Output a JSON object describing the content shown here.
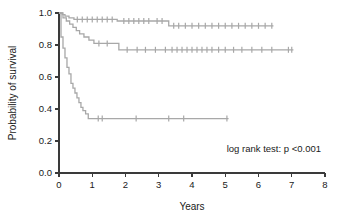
{
  "figure": {
    "width": 337,
    "height": 216,
    "background": "#ffffff"
  },
  "annotations": {
    "log_rank": "log rank test: p <0.001"
  },
  "chart_data": {
    "type": "line",
    "chart_kind": "kaplan-meier-survival",
    "title": "",
    "xlabel": "Years",
    "ylabel": "Probability of survival",
    "xlim": [
      0,
      8
    ],
    "ylim": [
      0.0,
      1.0
    ],
    "xticks": [
      0,
      1,
      2,
      3,
      4,
      5,
      6,
      7,
      8
    ],
    "xtick_labels": [
      "0",
      "1",
      "2",
      "3",
      "4",
      "5",
      "6",
      "7",
      "8"
    ],
    "yticks": [
      0.0,
      0.2,
      0.4,
      0.6,
      0.8,
      1.0
    ],
    "ytick_labels": [
      "0.0",
      "0.2",
      "0.4",
      "0.6",
      "0.8",
      "1.0"
    ],
    "grid": false,
    "legend": false,
    "legend_position": "none",
    "line_color": "#a8a8a8",
    "annotation_text": "log rank test: p <0.001",
    "series": [
      {
        "name": "curve-1-high-survival",
        "color": "#a8a8a8",
        "step": "post",
        "final_survival": 0.92,
        "x": [
          0.0,
          0.1,
          0.18,
          0.3,
          0.45,
          1.75,
          3.3,
          6.45
        ],
        "y": [
          1.0,
          0.99,
          0.98,
          0.97,
          0.96,
          0.95,
          0.92,
          0.92
        ],
        "censor_x": [
          0.55,
          0.7,
          0.85,
          1.0,
          1.15,
          1.3,
          1.45,
          1.6,
          1.95,
          2.1,
          2.25,
          2.4,
          2.55,
          2.7,
          2.95,
          3.1,
          3.45,
          3.6,
          3.8,
          4.0,
          4.2,
          4.4,
          4.6,
          4.8,
          5.0,
          5.2,
          5.4,
          5.6,
          5.8,
          6.0,
          6.2,
          6.4
        ],
        "censor_y": [
          0.96,
          0.96,
          0.96,
          0.96,
          0.96,
          0.96,
          0.96,
          0.96,
          0.95,
          0.95,
          0.95,
          0.95,
          0.95,
          0.95,
          0.95,
          0.95,
          0.92,
          0.92,
          0.92,
          0.92,
          0.92,
          0.92,
          0.92,
          0.92,
          0.92,
          0.92,
          0.92,
          0.92,
          0.92,
          0.92,
          0.92,
          0.92
        ]
      },
      {
        "name": "curve-2-intermediate-survival",
        "color": "#a8a8a8",
        "step": "post",
        "final_survival": 0.77,
        "x": [
          0.0,
          0.12,
          0.22,
          0.32,
          0.42,
          0.52,
          0.62,
          0.75,
          0.9,
          1.05,
          1.8,
          7.05
        ],
        "y": [
          1.0,
          0.97,
          0.95,
          0.93,
          0.91,
          0.89,
          0.87,
          0.85,
          0.83,
          0.81,
          0.77,
          0.77
        ],
        "censor_x": [
          1.2,
          1.45,
          2.05,
          2.35,
          2.6,
          2.9,
          3.2,
          3.4,
          3.55,
          3.7,
          3.85,
          4.0,
          4.15,
          4.3,
          4.45,
          4.6,
          4.8,
          5.0,
          5.25,
          5.5,
          5.8,
          6.1,
          6.4,
          6.9,
          7.0
        ],
        "censor_y": [
          0.81,
          0.81,
          0.77,
          0.77,
          0.77,
          0.77,
          0.77,
          0.77,
          0.77,
          0.77,
          0.77,
          0.77,
          0.77,
          0.77,
          0.77,
          0.77,
          0.77,
          0.77,
          0.77,
          0.77,
          0.77,
          0.77,
          0.77,
          0.77,
          0.77
        ]
      },
      {
        "name": "curve-3-low-survival",
        "color": "#a8a8a8",
        "step": "post",
        "final_survival": 0.34,
        "x": [
          0.0,
          0.06,
          0.12,
          0.18,
          0.24,
          0.3,
          0.36,
          0.42,
          0.48,
          0.54,
          0.6,
          0.66,
          0.72,
          0.8,
          0.88,
          5.1
        ],
        "y": [
          1.0,
          0.85,
          0.78,
          0.72,
          0.66,
          0.62,
          0.56,
          0.53,
          0.5,
          0.47,
          0.44,
          0.41,
          0.39,
          0.37,
          0.34,
          0.34
        ],
        "censor_x": [
          1.18,
          1.3,
          2.32,
          3.3,
          3.75,
          5.05
        ],
        "censor_y": [
          0.34,
          0.34,
          0.34,
          0.34,
          0.34,
          0.34
        ]
      }
    ]
  },
  "axes": {
    "x": {
      "label": "Years",
      "min": 0,
      "max": 8
    },
    "y": {
      "label": "Probability of survival",
      "min": 0,
      "max": 1
    }
  }
}
